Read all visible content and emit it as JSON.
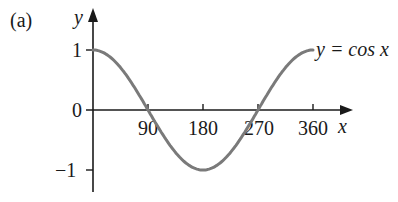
{
  "figure": {
    "part_label": "(a)",
    "curve_label": "y = cos x"
  },
  "colors": {
    "axis": "#1a1a1a",
    "curve": "#7a7a7a",
    "background": "#ffffff"
  },
  "chart_data": {
    "type": "line",
    "title": "",
    "part_label": "(a)",
    "xlabel": "x",
    "ylabel": "y",
    "xlim": [
      0,
      360
    ],
    "ylim": [
      -1,
      1
    ],
    "x_ticks": [
      90,
      180,
      270,
      360
    ],
    "x_tick_labels": [
      "90",
      "180",
      "270",
      "360"
    ],
    "y_ticks": [
      1,
      0,
      -1
    ],
    "y_tick_labels": [
      "1",
      "0",
      "−1"
    ],
    "grid": false,
    "legend": null,
    "annotations": [
      {
        "text": "y = cos x",
        "x": 360,
        "y": 1
      }
    ],
    "series": [
      {
        "name": "y = cos x",
        "x": [
          0,
          45,
          90,
          135,
          180,
          225,
          270,
          315,
          360
        ],
        "y": [
          1,
          0.707,
          0,
          -0.707,
          -1,
          -0.707,
          0,
          0.707,
          1
        ]
      }
    ]
  }
}
